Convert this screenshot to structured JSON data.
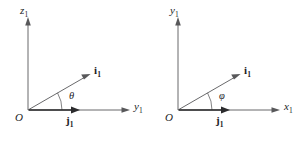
{
  "figure": {
    "background_color": "#ffffff",
    "line_color": "#58585a",
    "text_color": "#1d1d1f",
    "width": 301,
    "height": 144
  },
  "panels": [
    {
      "id": "left-panel",
      "origin_label": "O",
      "vertical_axis": {
        "symbol": "z",
        "subscript": "1"
      },
      "horizontal_axis": {
        "symbol": "y",
        "subscript": "1"
      },
      "angle": {
        "symbol": "θ",
        "name": "theta",
        "degrees": 30
      },
      "vectors": [
        {
          "name": "i-vector",
          "symbol": "i",
          "subscript": "1",
          "bold": true,
          "angle_degrees": 30
        },
        {
          "name": "j-vector",
          "symbol": "j",
          "subscript": "1",
          "bold": true,
          "angle_degrees": 0
        }
      ]
    },
    {
      "id": "right-panel",
      "origin_label": "O",
      "vertical_axis": {
        "symbol": "y",
        "subscript": "1"
      },
      "horizontal_axis": {
        "symbol": "x",
        "subscript": "1"
      },
      "angle": {
        "symbol": "φ",
        "name": "phi",
        "degrees": 30
      },
      "vectors": [
        {
          "name": "i-vector",
          "symbol": "i",
          "subscript": "1",
          "bold": true,
          "angle_degrees": 30
        },
        {
          "name": "j-vector",
          "symbol": "j",
          "subscript": "1",
          "bold": true,
          "angle_degrees": 0
        }
      ]
    }
  ]
}
